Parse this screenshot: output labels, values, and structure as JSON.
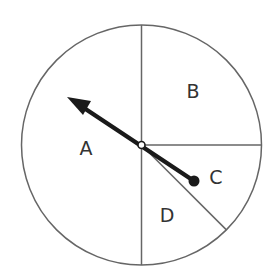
{
  "diagram": {
    "title": "",
    "type": "spinner",
    "sections": [
      {
        "label": "A",
        "description": "left half",
        "fraction": "1/2"
      },
      {
        "label": "B",
        "description": "upper-right quarter",
        "fraction": "1/4"
      },
      {
        "label": "C",
        "description": "small wedge right of center",
        "fraction": "1/8"
      },
      {
        "label": "D",
        "description": "lower wedge",
        "fraction": "1/8"
      }
    ],
    "pointer": {
      "direction": "upper-left, pointing into A"
    },
    "colors": {
      "stroke": "#666666",
      "arrow": "#1a1a1a",
      "text": "#333333",
      "background": "#ffffff"
    }
  }
}
